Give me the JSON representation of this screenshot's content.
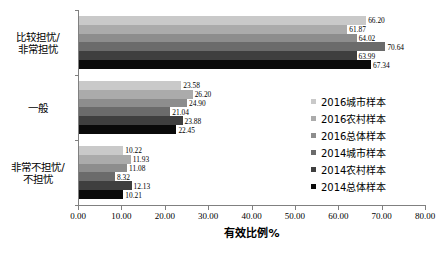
{
  "chart_data": {
    "type": "bar",
    "orientation": "horizontal",
    "title": "",
    "xlabel": "有效比例%",
    "ylabel": "",
    "xlim": [
      0,
      80
    ],
    "xticks": [
      "0.00",
      "10.00",
      "20.00",
      "30.00",
      "40.00",
      "50.00",
      "60.00",
      "70.00",
      "80.00"
    ],
    "xtick_values": [
      0,
      10,
      20,
      30,
      40,
      50,
      60,
      70,
      80
    ],
    "grid": false,
    "legend_position": "right",
    "categories": [
      "比较担忧/非常担忧",
      "一般",
      "非常不担忧/不担忧"
    ],
    "category_lines": [
      [
        "比较担忧/",
        "非常担忧"
      ],
      [
        "一般"
      ],
      [
        "非常不担忧/",
        "不担忧"
      ]
    ],
    "series": [
      {
        "name": "2016城市样本",
        "color": "#c9c9c9",
        "values": [
          66.2,
          23.58,
          10.22
        ],
        "labels": [
          "66.20",
          "23.58",
          "10.22"
        ]
      },
      {
        "name": "2016农村样本",
        "color": "#ababab",
        "values": [
          61.87,
          26.2,
          11.93
        ],
        "labels": [
          "61.87",
          "26.20",
          "11.93"
        ]
      },
      {
        "name": "2016总体样本",
        "color": "#8d8d8d",
        "values": [
          64.02,
          24.9,
          11.08
        ],
        "labels": [
          "64.02",
          "24.90",
          "11.08"
        ]
      },
      {
        "name": "2014城市样本",
        "color": "#6b6b6b",
        "values": [
          70.64,
          21.04,
          8.32
        ],
        "labels": [
          "70.64",
          "21.04",
          "8.32"
        ]
      },
      {
        "name": "2014农村样本",
        "color": "#3f3f3f",
        "values": [
          63.99,
          23.88,
          12.13
        ],
        "labels": [
          "63.99",
          "23.88",
          "12.13"
        ]
      },
      {
        "name": "2014总体样本",
        "color": "#0a0a0a",
        "values": [
          67.34,
          22.45,
          10.21
        ],
        "labels": [
          "67.34",
          "22.45",
          "10.21"
        ]
      }
    ]
  },
  "caption": ""
}
